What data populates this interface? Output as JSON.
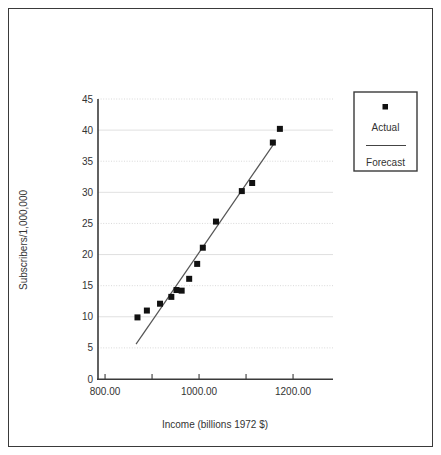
{
  "chart_data": {
    "type": "scatter",
    "title": "",
    "xlabel": "Income (billions 1972 $)",
    "ylabel": "Subscribers/1,000,000",
    "xlim": [
      785,
      1285
    ],
    "ylim": [
      0,
      45
    ],
    "xticks": [
      800,
      900,
      1000,
      1100,
      1200
    ],
    "xtick_labels": [
      "800.00",
      "",
      "1000.00",
      "",
      "1200.00"
    ],
    "yticks": [
      0,
      5,
      10,
      15,
      20,
      25,
      30,
      35,
      40,
      45
    ],
    "ytick_labels": [
      "0",
      "5",
      "10",
      "15",
      "20",
      "25",
      "30",
      "35",
      "40",
      "45"
    ],
    "grid": true,
    "grid_axis": "y",
    "legend_position": "right-outside",
    "series": [
      {
        "name": "Actual",
        "type": "scatter",
        "marker": "square",
        "color": "#111111",
        "points": [
          {
            "x": 869,
            "y": 9.9
          },
          {
            "x": 889,
            "y": 11.0
          },
          {
            "x": 917,
            "y": 12.1
          },
          {
            "x": 941,
            "y": 13.2
          },
          {
            "x": 963,
            "y": 14.2
          },
          {
            "x": 979,
            "y": 16.1
          },
          {
            "x": 996,
            "y": 18.5
          },
          {
            "x": 1008,
            "y": 21.1
          },
          {
            "x": 1036,
            "y": 25.3
          },
          {
            "x": 1091,
            "y": 30.2
          },
          {
            "x": 1113,
            "y": 31.5
          },
          {
            "x": 1157,
            "y": 38.0
          },
          {
            "x": 1172,
            "y": 40.2
          },
          {
            "x": 952,
            "y": 14.3
          }
        ]
      },
      {
        "name": "Forecast",
        "type": "line",
        "color": "#555555",
        "points": [
          {
            "x": 866,
            "y": 5.6
          },
          {
            "x": 1162,
            "y": 38.1
          }
        ]
      }
    ]
  },
  "legend": {
    "items": [
      {
        "label": "Actual",
        "marker": "square",
        "color": "#111111"
      },
      {
        "label": "Forecast",
        "marker": "line",
        "color": "#555555"
      }
    ]
  },
  "axes": {
    "x_title": "Income (billions 1972 $)",
    "y_title": "Subscribers/1,000,000"
  }
}
